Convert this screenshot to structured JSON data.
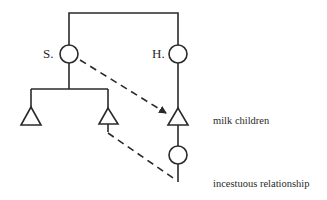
{
  "diagram": {
    "type": "kinship",
    "stroke_color": "#2a2a2a",
    "background": "#ffffff",
    "nodes": [
      {
        "id": "S",
        "shape": "circle",
        "label": "S."
      },
      {
        "id": "H",
        "shape": "circle",
        "label": "H."
      },
      {
        "id": "S_child_1",
        "shape": "triangle",
        "label": ""
      },
      {
        "id": "S_child_2",
        "shape": "triangle",
        "label": ""
      },
      {
        "id": "H_child_male",
        "shape": "triangle",
        "label": ""
      },
      {
        "id": "H_child_female",
        "shape": "circle",
        "label": ""
      }
    ],
    "edges": [
      {
        "from": "S",
        "to": "H",
        "style": "solid",
        "kind": "sibling-link"
      },
      {
        "from": "S",
        "to": "S_child_1",
        "style": "solid",
        "kind": "descent"
      },
      {
        "from": "S",
        "to": "S_child_2",
        "style": "solid",
        "kind": "descent"
      },
      {
        "from": "H",
        "to": "H_child_male",
        "style": "solid",
        "kind": "descent"
      },
      {
        "from": "H_child_male",
        "to": "H_child_female",
        "style": "solid",
        "kind": "descent"
      },
      {
        "from": "S",
        "to": "H_child_male",
        "style": "dashed-arrow",
        "kind": "milk-nursing"
      },
      {
        "from": "S_child_2",
        "to": "H_child_female",
        "style": "dashed",
        "kind": "relationship"
      }
    ],
    "annotations": {
      "milk_children": "milk children",
      "incestuous_relationship": "incestuous relationship"
    }
  }
}
